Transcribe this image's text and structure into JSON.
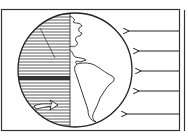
{
  "diagram": {
    "colors": {
      "ink": "#222222",
      "background": "#ffffff",
      "night_shading": "#333333"
    },
    "globe": {
      "day_side": "right",
      "night_side": "left",
      "continents": [
        "North America",
        "South America"
      ]
    },
    "sunlight_arrows": {
      "count": 5,
      "direction": "left"
    },
    "rotation_arrow": {
      "direction": "right",
      "location": "night side, lower"
    }
  }
}
